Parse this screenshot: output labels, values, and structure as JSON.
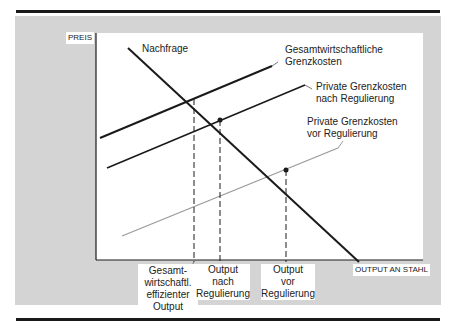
{
  "axes": {
    "y_label": "PREIS",
    "x_label": "OUTPUT AN STAHL"
  },
  "curves": {
    "demand": "Nachfrage",
    "social_mc_1": "Gesamtwirtschaftliche",
    "social_mc_2": "Grenzkosten",
    "private_after_1": "Private Grenzkosten",
    "private_after_2": "nach Regulierung",
    "private_before_1": "Private Grenzkosten",
    "private_before_2": "vor Regulierung"
  },
  "x_marks": {
    "efficient": [
      "Gesamt-",
      "wirtschaftl.",
      "effizienter",
      "Output"
    ],
    "after": [
      "Output",
      "nach",
      "Regulierung"
    ],
    "before": [
      "Output",
      "vor",
      "Regulierung"
    ]
  },
  "colors": {
    "panel": "#d4d4d4",
    "line": "#1a1a1a",
    "light_line": "#9a9a9a"
  }
}
